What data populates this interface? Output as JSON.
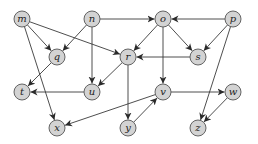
{
  "diagram": {
    "type": "directed-graph",
    "node_radius": 8,
    "colors": {
      "node_fill": "#d3d3d3",
      "node_stroke": "#555555",
      "edge": "#3a3a3a",
      "background": "#ffffff"
    },
    "nodes": [
      {
        "id": "m",
        "label": "m",
        "x": 22,
        "y": 19
      },
      {
        "id": "n",
        "label": "n",
        "x": 92,
        "y": 19
      },
      {
        "id": "o",
        "label": "o",
        "x": 163,
        "y": 19
      },
      {
        "id": "p",
        "label": "p",
        "x": 233,
        "y": 19
      },
      {
        "id": "q",
        "label": "q",
        "x": 57,
        "y": 57
      },
      {
        "id": "r",
        "label": "r",
        "x": 128,
        "y": 57
      },
      {
        "id": "s",
        "label": "s",
        "x": 198,
        "y": 57
      },
      {
        "id": "t",
        "label": "t",
        "x": 22,
        "y": 92
      },
      {
        "id": "u",
        "label": "u",
        "x": 92,
        "y": 92
      },
      {
        "id": "v",
        "label": "v",
        "x": 163,
        "y": 92
      },
      {
        "id": "w",
        "label": "w",
        "x": 233,
        "y": 92
      },
      {
        "id": "x",
        "label": "x",
        "x": 57,
        "y": 128
      },
      {
        "id": "y",
        "label": "y",
        "x": 128,
        "y": 128
      },
      {
        "id": "z",
        "label": "z",
        "x": 198,
        "y": 128
      }
    ],
    "edges": [
      {
        "from": "m",
        "to": "q"
      },
      {
        "from": "m",
        "to": "r"
      },
      {
        "from": "m",
        "to": "x"
      },
      {
        "from": "n",
        "to": "q"
      },
      {
        "from": "n",
        "to": "u"
      },
      {
        "from": "n",
        "to": "o"
      },
      {
        "from": "o",
        "to": "r"
      },
      {
        "from": "o",
        "to": "s"
      },
      {
        "from": "o",
        "to": "v"
      },
      {
        "from": "p",
        "to": "o"
      },
      {
        "from": "p",
        "to": "s"
      },
      {
        "from": "p",
        "to": "z"
      },
      {
        "from": "q",
        "to": "t"
      },
      {
        "from": "r",
        "to": "u"
      },
      {
        "from": "r",
        "to": "y"
      },
      {
        "from": "s",
        "to": "r"
      },
      {
        "from": "u",
        "to": "t"
      },
      {
        "from": "v",
        "to": "x"
      },
      {
        "from": "v",
        "to": "w"
      },
      {
        "from": "w",
        "to": "z"
      },
      {
        "from": "y",
        "to": "v"
      }
    ]
  }
}
